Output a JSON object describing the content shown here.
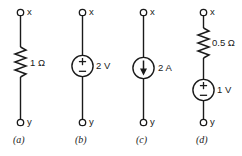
{
  "figure": {
    "terminal_top_label": "x",
    "terminal_bottom_label": "y",
    "background_color": "#ffffff",
    "line_color": "#1a1a1a"
  },
  "circuits": [
    {
      "id": "a",
      "caption": "(a)",
      "top_terminal": "x",
      "bottom_terminal": "y",
      "elements": [
        {
          "type": "resistor",
          "symbol": "zigzag",
          "value": "1 Ω",
          "magnitude": 1,
          "unit": "Ω"
        }
      ]
    },
    {
      "id": "b",
      "caption": "(b)",
      "top_terminal": "x",
      "bottom_terminal": "y",
      "elements": [
        {
          "type": "voltage-source",
          "symbol": "circle-plus-minus",
          "value": "2 V",
          "magnitude": 2,
          "unit": "V",
          "plus_sign": "+",
          "minus_sign": "−",
          "polarity": "plus-on-top"
        }
      ]
    },
    {
      "id": "c",
      "caption": "(c)",
      "top_terminal": "x",
      "bottom_terminal": "y",
      "elements": [
        {
          "type": "current-source",
          "symbol": "circle-arrow",
          "value": "2 A",
          "magnitude": 2,
          "unit": "A",
          "arrow_direction": "down"
        }
      ]
    },
    {
      "id": "d",
      "caption": "(d)",
      "top_terminal": "x",
      "bottom_terminal": "y",
      "elements": [
        {
          "type": "resistor",
          "symbol": "zigzag",
          "value": "0.5 Ω",
          "magnitude": 0.5,
          "unit": "Ω"
        },
        {
          "type": "voltage-source",
          "symbol": "circle-plus-minus",
          "value": "1 V",
          "magnitude": 1,
          "unit": "V",
          "plus_sign": "+",
          "minus_sign": "−",
          "polarity": "plus-on-top"
        }
      ]
    }
  ]
}
